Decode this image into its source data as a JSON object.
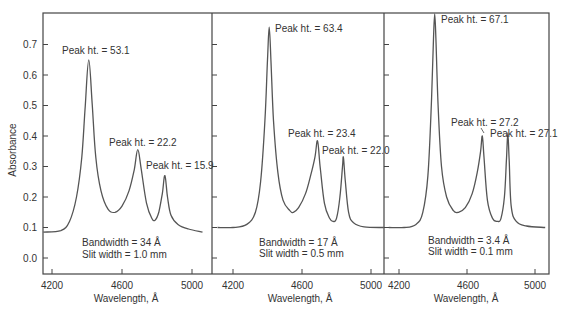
{
  "figure": {
    "ylabel": "Absorbance",
    "xlabel": "Wavelength, Å",
    "yticks": [
      "0.0",
      "0.1",
      "0.2",
      "0.3",
      "0.4",
      "0.5",
      "0.6",
      "0.7"
    ],
    "line_color": "#555555",
    "frame_color": "#444444"
  },
  "chart_data": [
    {
      "type": "line",
      "title": "",
      "xlabel": "Wavelength, Å",
      "ylabel": "Absorbance",
      "xticks": [
        4200,
        4600,
        5000
      ],
      "xlim": [
        4180,
        5110
      ],
      "ylim": [
        -0.05,
        0.8
      ],
      "grid": false,
      "annotations": {
        "bandwidth": "Bandwidth = 34 Å",
        "slit": "Slit width = 1.0 mm",
        "peaks": [
          "Peak ht. = 53.1",
          "Peak ht. = 22.2",
          "Peak ht. = 15.9"
        ]
      },
      "peaks": [
        {
          "x": 4410,
          "y": 0.65,
          "label": "Peak ht. = 53.1"
        },
        {
          "x": 4690,
          "y": 0.355,
          "label": "Peak ht. = 22.2"
        },
        {
          "x": 4845,
          "y": 0.27,
          "label": "Peak ht. = 15.9"
        }
      ],
      "series": [
        {
          "name": "Bandwidth 34 Å",
          "x": [
            4150,
            4250,
            4300,
            4340,
            4370,
            4390,
            4410,
            4430,
            4450,
            4480,
            4520,
            4560,
            4600,
            4640,
            4670,
            4690,
            4710,
            4740,
            4770,
            4790,
            4810,
            4830,
            4845,
            4860,
            4880,
            4920,
            4980,
            5060
          ],
          "y": [
            0.085,
            0.09,
            0.12,
            0.2,
            0.33,
            0.5,
            0.65,
            0.5,
            0.33,
            0.22,
            0.16,
            0.15,
            0.17,
            0.22,
            0.29,
            0.355,
            0.29,
            0.18,
            0.13,
            0.125,
            0.15,
            0.21,
            0.27,
            0.2,
            0.14,
            0.11,
            0.095,
            0.085
          ]
        }
      ]
    },
    {
      "type": "line",
      "title": "",
      "xlabel": "Wavelength, Å",
      "ylabel": "",
      "xticks": [
        4200,
        4600,
        5000
      ],
      "xlim": [
        4100,
        5080
      ],
      "ylim": [
        -0.05,
        0.8
      ],
      "grid": false,
      "annotations": {
        "bandwidth": "Bandwidth = 17 Å",
        "slit": "Slit width = 0.5 mm",
        "peaks": [
          "Peak ht. = 63.4",
          "Peak ht. = 23.4",
          "Peak ht. = 22.0"
        ]
      },
      "peaks": [
        {
          "x": 4410,
          "y": 0.757,
          "label": "Peak ht. = 63.4"
        },
        {
          "x": 4690,
          "y": 0.384,
          "label": "Peak ht. = 23.4"
        },
        {
          "x": 4840,
          "y": 0.33,
          "label": "Peak ht. = 22.0"
        }
      ],
      "series": [
        {
          "name": "Bandwidth 17 Å",
          "x": [
            4110,
            4200,
            4280,
            4330,
            4360,
            4385,
            4400,
            4410,
            4420,
            4435,
            4460,
            4490,
            4530,
            4550,
            4580,
            4620,
            4650,
            4675,
            4690,
            4705,
            4730,
            4760,
            4780,
            4800,
            4820,
            4835,
            4840,
            4850,
            4870,
            4900,
            4960,
            5075
          ],
          "y": [
            0.1,
            0.1,
            0.11,
            0.15,
            0.25,
            0.45,
            0.65,
            0.757,
            0.65,
            0.45,
            0.28,
            0.19,
            0.155,
            0.15,
            0.165,
            0.21,
            0.27,
            0.33,
            0.384,
            0.3,
            0.18,
            0.13,
            0.12,
            0.13,
            0.2,
            0.3,
            0.33,
            0.26,
            0.15,
            0.115,
            0.102,
            0.1
          ]
        }
      ]
    },
    {
      "type": "line",
      "title": "",
      "xlabel": "Wavelength, Å",
      "ylabel": "",
      "xticks": [
        4200,
        4600,
        5000
      ],
      "xlim": [
        4110,
        5090
      ],
      "ylim": [
        -0.05,
        0.8
      ],
      "grid": false,
      "annotations": {
        "bandwidth": "Bandwidth = 3.4 Å",
        "slit": "Slit width = 0.1 mm",
        "peaks": [
          "Peak ht. = 67.1",
          "Peak ht. = 27.2",
          "Peak ht. = 27.1"
        ]
      },
      "peaks": [
        {
          "x": 4410,
          "y": 0.8,
          "label": "Peak ht. = 67.1"
        },
        {
          "x": 4690,
          "y": 0.4,
          "label": "Peak ht. = 27.2"
        },
        {
          "x": 4840,
          "y": 0.41,
          "label": "Peak ht. = 27.1"
        }
      ],
      "series": [
        {
          "name": "Bandwidth 3.4 Å",
          "x": [
            4140,
            4230,
            4300,
            4340,
            4370,
            4390,
            4403,
            4410,
            4417,
            4430,
            4450,
            4480,
            4520,
            4550,
            4590,
            4630,
            4660,
            4680,
            4690,
            4700,
            4720,
            4750,
            4780,
            4800,
            4820,
            4832,
            4840,
            4848,
            4860,
            4890,
            4950,
            5060
          ],
          "y": [
            0.1,
            0.1,
            0.11,
            0.15,
            0.27,
            0.5,
            0.72,
            0.8,
            0.72,
            0.5,
            0.3,
            0.2,
            0.155,
            0.15,
            0.165,
            0.21,
            0.28,
            0.35,
            0.4,
            0.33,
            0.19,
            0.13,
            0.12,
            0.13,
            0.2,
            0.32,
            0.41,
            0.32,
            0.17,
            0.12,
            0.105,
            0.1
          ]
        }
      ]
    }
  ]
}
